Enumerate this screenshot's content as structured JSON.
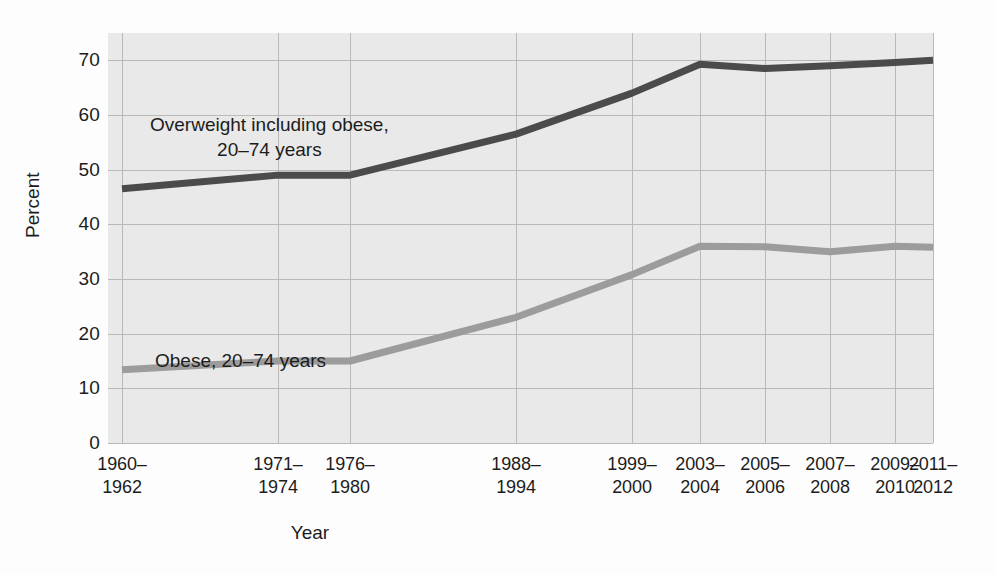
{
  "chart_data": {
    "type": "line",
    "title": "",
    "xlabel": "Year",
    "ylabel": "Percent",
    "ylim": [
      0,
      75
    ],
    "yticks": [
      0,
      10,
      20,
      30,
      40,
      50,
      60,
      70
    ],
    "grid": true,
    "legend_position": "in-plot annotations",
    "categories": [
      "1960–\n1962",
      "1971–\n1974",
      "1976–\n1980",
      "1988–\n1994",
      "1999–\n2000",
      "2003–\n2004",
      "2005–\n2006",
      "2007–\n2008",
      "2009–\n2010",
      "2011–\n2012"
    ],
    "series": [
      {
        "name": "Overweight including obese, 20–74 years",
        "color": "#4b4b4b",
        "values": [
          46.5,
          49.0,
          49.0,
          56.5,
          64.0,
          69.3,
          68.5,
          69.0,
          69.6,
          70.0
        ]
      },
      {
        "name": "Obese, 20–74 years",
        "color": "#9c9c9c",
        "values": [
          13.4,
          15.0,
          15.0,
          23.0,
          30.8,
          36.0,
          35.9,
          35.0,
          36.0,
          35.8
        ]
      }
    ],
    "annotations": [
      {
        "id": "overweight",
        "text": "Overweight including obese,\n20–74 years"
      },
      {
        "id": "obese",
        "text": "Obese, 20–74 years"
      }
    ],
    "colors": {
      "plot_background": "#e9e9e9",
      "grid": "#b9b9b9",
      "text": "#1c1c1c",
      "series_dark": "#4b4b4b",
      "series_light": "#9c9c9c"
    }
  }
}
